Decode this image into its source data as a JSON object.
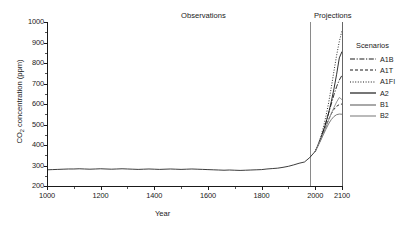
{
  "chart_data": {
    "type": "line",
    "title": "",
    "xlabel": "Year",
    "ylabel": "CO2 concentration (ppm)",
    "ylabel_prefix": "CO",
    "ylabel_sub": "2",
    "ylabel_suffix": " concentration (ppm)",
    "xlim": [
      1000,
      2100
    ],
    "ylim": [
      200,
      1000
    ],
    "xticks": [
      1000,
      1200,
      1400,
      1600,
      1800,
      2000,
      2100
    ],
    "xtick_labels": [
      "1000",
      "1200",
      "1400",
      "1600",
      "1800",
      "2000",
      "2100"
    ],
    "xticks_minor": [
      1100,
      1300,
      1500,
      1700,
      1900
    ],
    "yticks": [
      200,
      300,
      400,
      500,
      600,
      700,
      800,
      900,
      1000
    ],
    "ytick_labels": [
      "200",
      "300",
      "400",
      "500",
      "600",
      "700",
      "800",
      "900",
      "1000"
    ],
    "yticks_minor": [
      250,
      350,
      450,
      550,
      650,
      750,
      850,
      950
    ],
    "grid": false,
    "legend_position": "right",
    "annotations": [
      {
        "text": "Observations",
        "x": 1700,
        "y": 1010
      },
      {
        "text": "Projections",
        "x": 2020,
        "y": 1010
      }
    ],
    "divider_x": 2000,
    "series": [
      {
        "name": "Observations",
        "style": "solid",
        "color": "#1a1a1a",
        "x": [
          1000,
          1020,
          1040,
          1060,
          1080,
          1100,
          1120,
          1140,
          1160,
          1180,
          1200,
          1220,
          1240,
          1260,
          1280,
          1300,
          1320,
          1340,
          1360,
          1380,
          1400,
          1420,
          1440,
          1460,
          1480,
          1500,
          1520,
          1540,
          1560,
          1580,
          1600,
          1620,
          1640,
          1660,
          1680,
          1700,
          1720,
          1740,
          1760,
          1780,
          1800,
          1820,
          1840,
          1860,
          1880,
          1900,
          1920,
          1940,
          1960,
          1980,
          2000
        ],
        "y": [
          279,
          280,
          281,
          282,
          283,
          283,
          284,
          283,
          282,
          283,
          284,
          283,
          282,
          283,
          284,
          283,
          282,
          281,
          282,
          283,
          282,
          281,
          282,
          283,
          282,
          281,
          282,
          283,
          282,
          281,
          280,
          279,
          278,
          277,
          278,
          277,
          276,
          277,
          278,
          279,
          280,
          283,
          285,
          287,
          291,
          296,
          303,
          311,
          317,
          339,
          369
        ]
      },
      {
        "name": "A1B",
        "style": "dashdot",
        "color": "#1a1a1a",
        "x": [
          2000,
          2010,
          2020,
          2030,
          2040,
          2050,
          2060,
          2070,
          2080,
          2090,
          2100
        ],
        "y": [
          369,
          397,
          430,
          468,
          510,
          555,
          600,
          645,
          685,
          717,
          740
        ]
      },
      {
        "name": "A1T",
        "style": "dashed",
        "color": "#1a1a1a",
        "x": [
          2000,
          2010,
          2020,
          2030,
          2040,
          2050,
          2060,
          2070,
          2080,
          2090,
          2100
        ],
        "y": [
          369,
          396,
          426,
          458,
          492,
          524,
          552,
          574,
          589,
          597,
          600
        ]
      },
      {
        "name": "A1FI",
        "style": "dotted",
        "color": "#1a1a1a",
        "x": [
          2000,
          2010,
          2020,
          2030,
          2040,
          2050,
          2060,
          2070,
          2080,
          2090,
          2100
        ],
        "y": [
          369,
          399,
          437,
          484,
          540,
          605,
          680,
          760,
          838,
          905,
          958
        ]
      },
      {
        "name": "A2",
        "style": "solid",
        "color": "#1a1a1a",
        "x": [
          2000,
          2010,
          2020,
          2030,
          2040,
          2050,
          2060,
          2070,
          2080,
          2090,
          2100
        ],
        "y": [
          369,
          397,
          429,
          466,
          508,
          556,
          611,
          674,
          745,
          825,
          856
        ]
      },
      {
        "name": "B1",
        "style": "solid",
        "color": "#6e6e6e",
        "x": [
          2000,
          2010,
          2020,
          2030,
          2040,
          2050,
          2060,
          2070,
          2080,
          2090,
          2100
        ],
        "y": [
          369,
          394,
          421,
          449,
          477,
          503,
          524,
          539,
          548,
          551,
          550
        ]
      },
      {
        "name": "B2",
        "style": "solid",
        "color": "#8c8c8c",
        "x": [
          2000,
          2010,
          2020,
          2030,
          2040,
          2050,
          2060,
          2070,
          2080,
          2090,
          2100
        ],
        "y": [
          369,
          395,
          424,
          455,
          488,
          521,
          553,
          583,
          610,
          632,
          621
        ]
      }
    ]
  },
  "legend": {
    "title": "Scenarios",
    "items": [
      {
        "label": "A1B",
        "style": "dashdot"
      },
      {
        "label": "A1T",
        "style": "dashed"
      },
      {
        "label": "A1FI",
        "style": "dotted"
      },
      {
        "label": "A2",
        "style": "solid"
      },
      {
        "label": "B1",
        "style": "solid"
      },
      {
        "label": "B2",
        "style": "solid"
      }
    ]
  }
}
